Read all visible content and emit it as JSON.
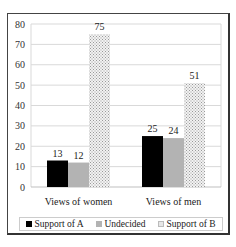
{
  "chart_data": {
    "type": "bar",
    "title": "",
    "xlabel": "",
    "ylabel": "",
    "ylim": [
      0,
      80
    ],
    "yticks": [
      0,
      10,
      20,
      30,
      40,
      50,
      60,
      70,
      80
    ],
    "grid": true,
    "legend_position": "bottom",
    "categories": [
      "Views of women",
      "Views of men"
    ],
    "series": [
      {
        "name": "Support of A",
        "values": [
          13,
          25
        ],
        "color": "#000000",
        "pattern": "solid"
      },
      {
        "name": "Undecided",
        "values": [
          12,
          24
        ],
        "color": "#b3b3b3",
        "pattern": "solid"
      },
      {
        "name": "Support of B",
        "values": [
          75,
          51
        ],
        "color": "#e0e0e0",
        "pattern": "dotted-hatch"
      }
    ]
  },
  "legend": {
    "items": [
      {
        "label": "Support of A"
      },
      {
        "label": "Undecided"
      },
      {
        "label": "Support of B"
      }
    ]
  }
}
